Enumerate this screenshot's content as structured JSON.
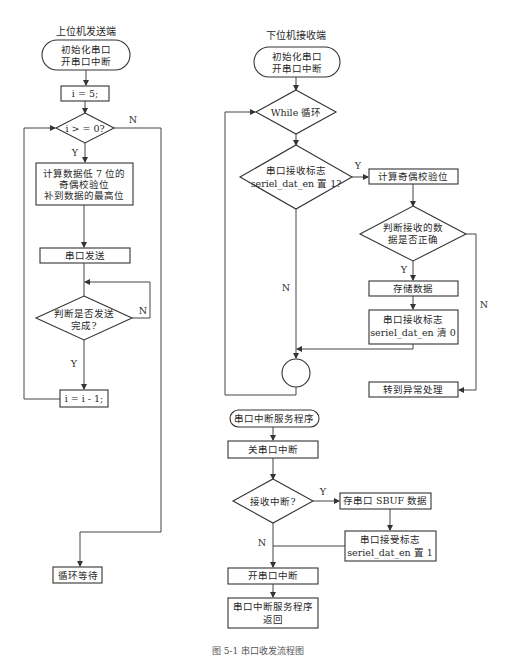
{
  "diagram": {
    "caption": "图 5-1  串口收发流程图",
    "sender": {
      "title": "上位机发送端",
      "nodes": {
        "init": [
          "初始化串口",
          "开串口中断"
        ],
        "set_i": "i = 5;",
        "cond_i": "i > = 0?",
        "calc_parity": [
          "计算数据低 7 位的",
          "奇偶校验位",
          "补到数据的最高位"
        ],
        "send": "串口发送",
        "check_sent": [
          "判断是否发送",
          "完成?"
        ],
        "decrement": "i = i - 1;",
        "wait": "循环等待"
      },
      "labels": {
        "cond_i_yes": "Y",
        "cond_i_no": "N",
        "check_sent_yes": "Y",
        "check_sent_no": "N"
      }
    },
    "receiver": {
      "title": "下位机接收端",
      "nodes": {
        "init": [
          "初始化串口",
          "开串口中断"
        ],
        "while_loop": "While 循环",
        "flag_check": [
          "串口接收标志",
          "seriel_dat_en 置 1?"
        ],
        "calc_parity": "计算奇偶校验位",
        "verify": [
          "判断接收的数",
          "据是否正确"
        ],
        "store": "存储数据",
        "clear_flag": [
          "串口接收标志",
          "seriel_dat_en 清 0"
        ],
        "error": "转到异常处理"
      },
      "labels": {
        "flag_yes": "Y",
        "flag_no": "N",
        "verify_yes": "Y",
        "verify_no": "N"
      }
    },
    "isr": {
      "nodes": {
        "start": "串口中断服务程序",
        "disable": "关串口中断",
        "rx_check": "接收中断?",
        "save_sbuf": "存串口 SBUF 数据",
        "set_flag": [
          "串口接受标志",
          "seriel_dat_en 置 1"
        ],
        "enable": "开串口中断",
        "return": [
          "串口中断服务程序",
          "返回"
        ]
      },
      "labels": {
        "rx_yes": "Y",
        "rx_no": "N"
      }
    }
  }
}
